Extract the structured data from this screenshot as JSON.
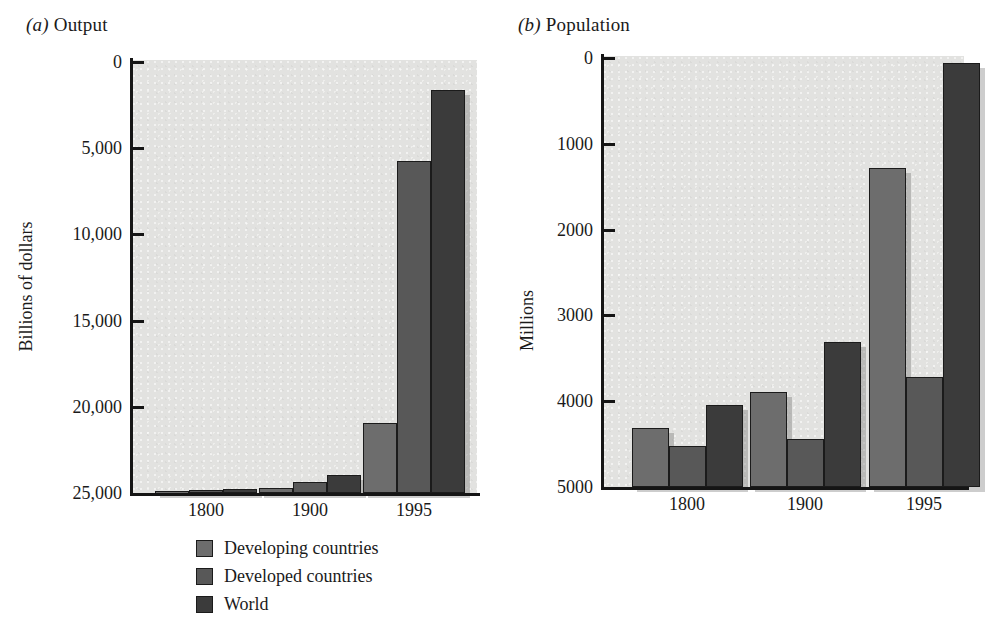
{
  "figure": {
    "panels": [
      {
        "id": "output",
        "label_prefix": "(a)",
        "title": "Output",
        "ylabel": "Billions of dollars",
        "yticks": [
          "25,000",
          "20,000",
          "15,000",
          "10,000",
          "5,000",
          "0"
        ],
        "ytick_values": [
          25000,
          20000,
          15000,
          10000,
          5000,
          0
        ],
        "xticks": [
          "1800",
          "1900",
          "1995"
        ]
      },
      {
        "id": "population",
        "label_prefix": "(b)",
        "title": "Population",
        "ylabel": "Millions",
        "yticks": [
          "5000",
          "4000",
          "3000",
          "2000",
          "1000",
          "0"
        ],
        "ytick_values": [
          5000,
          4000,
          3000,
          2000,
          1000,
          0
        ],
        "xticks": [
          "1800",
          "1900",
          "1995"
        ]
      }
    ],
    "legend": [
      {
        "label": "Developing countries",
        "color": "#6d6d6d"
      },
      {
        "label": "Developed countries",
        "color": "#585858"
      },
      {
        "label": "World",
        "color": "#3b3b3b"
      }
    ]
  },
  "chart_data": [
    {
      "type": "bar",
      "title": "(a) Output",
      "xlabel": "",
      "ylabel": "Billions of dollars",
      "categories": [
        "1800",
        "1900",
        "1995"
      ],
      "ylim": [
        0,
        25000
      ],
      "yticks": [
        0,
        5000,
        10000,
        15000,
        20000,
        25000
      ],
      "grid": false,
      "legend_position": "below-axes",
      "series": [
        {
          "name": "Developing countries",
          "color": "#6d6d6d",
          "values": [
            100,
            290,
            4050
          ]
        },
        {
          "name": "Developed countries",
          "color": "#585858",
          "values": [
            150,
            620,
            19250
          ]
        },
        {
          "name": "World",
          "color": "#3b3b3b",
          "values": [
            250,
            1050,
            23400
          ]
        }
      ]
    },
    {
      "type": "bar",
      "title": "(b) Population",
      "xlabel": "",
      "ylabel": "Millions",
      "categories": [
        "1800",
        "1900",
        "1995"
      ],
      "ylim": [
        0,
        5000
      ],
      "yticks": [
        0,
        1000,
        2000,
        3000,
        4000,
        5000
      ],
      "grid": false,
      "legend_position": "below-axes",
      "series": [
        {
          "name": "Developing countries",
          "color": "#6d6d6d",
          "values": [
            690,
            1110,
            3720
          ]
        },
        {
          "name": "Developed countries",
          "color": "#585858",
          "values": [
            480,
            560,
            1280
          ]
        },
        {
          "name": "World",
          "color": "#3b3b3b",
          "values": [
            950,
            1690,
            4940
          ]
        }
      ]
    }
  ]
}
